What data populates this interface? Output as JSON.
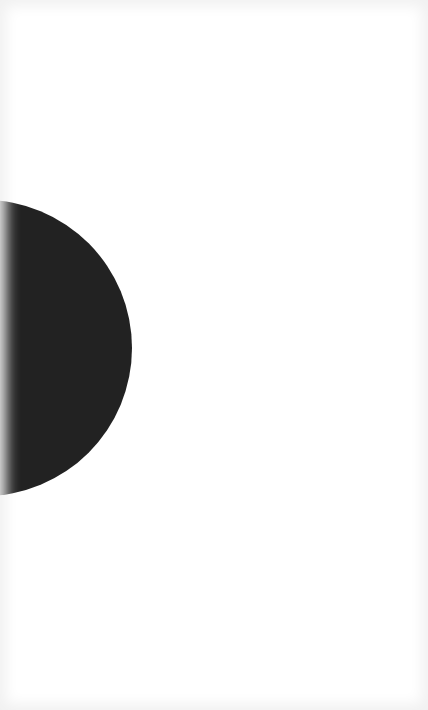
{
  "screen": {
    "background_color": "#ffffff",
    "edge_shade_color": "#f1f1f1"
  },
  "shape": {
    "type": "circle-partially-offscreen",
    "color": "#222222"
  }
}
